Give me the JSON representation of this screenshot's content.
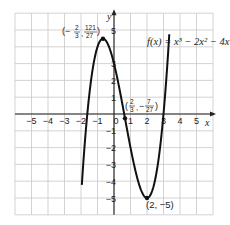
{
  "chart_data": {
    "type": "line",
    "title": "",
    "function_label": "f(x) = x³ − 2x² − 4x + 3",
    "xlabel": "x",
    "ylabel": "y",
    "xlim": [
      -6,
      6
    ],
    "ylim": [
      -6,
      6
    ],
    "grid": true,
    "x_ticks": [
      "-5",
      "-4",
      "-3",
      "-2",
      "-1",
      "0",
      "1",
      "2",
      "3",
      "4",
      "5"
    ],
    "y_ticks": [
      "5",
      "3",
      "2",
      "1",
      "-1",
      "-2",
      "-3",
      "-4",
      "-5"
    ],
    "series": [
      {
        "name": "f(x) = x^3 - 2x^2 - 4x + 3",
        "expression": "x^3 - 2x^2 - 4x + 3",
        "x_range": [
          -1.95,
          3.35
        ]
      }
    ],
    "annotations": [
      {
        "label": "(−2/3, 121/27)",
        "x": -0.667,
        "y": 4.481,
        "kind": "local-maximum"
      },
      {
        "label": "(2/3, −7/27)",
        "x": 0.667,
        "y": -0.259,
        "kind": "inflection-point"
      },
      {
        "label": "(2, −5)",
        "x": 2,
        "y": -5,
        "kind": "local-minimum"
      }
    ]
  },
  "labels": {
    "x_axis": "x",
    "y_axis": "y",
    "function": "f(x) = x³ − 2x² − 4x + 3",
    "max_point": "(−",
    "max_x_num": "2",
    "max_x_den": "3",
    "max_y_num": "121",
    "max_y_den": "27",
    "infl_prefix": "(",
    "infl_x_num": "2",
    "infl_x_den": "3",
    "infl_y_num": "7",
    "infl_y_den": "27",
    "min_point": "(2, −5)"
  }
}
